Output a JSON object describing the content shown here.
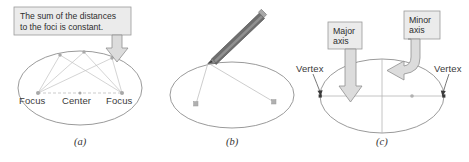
{
  "figure": {
    "background_color": "#ffffff",
    "ellipse_stroke": "#8a8a8a",
    "callout_fill": "#ebebeb",
    "callout_border": "#9a9a9a",
    "arrow_fill": "#dcdcdc",
    "arrow_border": "#8f8f8f",
    "point_color": "#9b9b9b",
    "line_color": "#b9b9b9",
    "text_color": "#2e2e2e"
  },
  "panel_a": {
    "caption": "(a)",
    "callout": {
      "line1": "The sum of the distances",
      "line2": "to the foci is constant."
    },
    "labels": {
      "focus_left": "Focus",
      "center": "Center",
      "focus_right": "Focus"
    }
  },
  "panel_b": {
    "caption": "(b)",
    "pencil_icon": "pencil-icon"
  },
  "panel_c": {
    "caption": "(c)",
    "callouts": {
      "major": {
        "line1": "Major",
        "line2": "axis"
      },
      "minor": {
        "line1": "Minor",
        "line2": "axis"
      }
    },
    "labels": {
      "vertex_left": "Vertex",
      "vertex_right": "Vertex"
    }
  }
}
